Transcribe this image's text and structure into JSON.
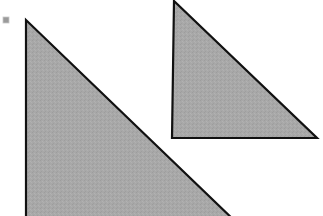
{
  "canvas": {
    "width": 323,
    "height": 216,
    "background_color": "#ffffff",
    "description": "Two gray right triangles on a white background"
  },
  "style": {
    "shape_fill_color": "#a8a8a8",
    "shape_stroke_color": "#111111",
    "shape_stroke_width": 2.2,
    "marker_fill_color": "#9a9a9a",
    "marker_border_color": "#c8c8c8",
    "texture_opacity": 0.1
  },
  "shapes": [
    {
      "name": "left-triangle",
      "label": "Large gray right triangle, clipped at bottom edge",
      "orientation": "right angle at lower-left",
      "points": "26,20 26,224 238,224",
      "vertices": [
        {
          "x": 26,
          "y": 20
        },
        {
          "x": 26,
          "y": 224
        },
        {
          "x": 238,
          "y": 224
        }
      ],
      "fill": "#a8a8a8",
      "stroke": "#111111"
    },
    {
      "name": "right-triangle",
      "label": "Smaller gray right triangle",
      "orientation": "right angle at lower-left",
      "points": "174,1 172,138 317,138",
      "vertices": [
        {
          "x": 174,
          "y": 1
        },
        {
          "x": 172,
          "y": 138
        },
        {
          "x": 317,
          "y": 138
        }
      ],
      "fill": "#a8a8a8",
      "stroke": "#111111"
    }
  ],
  "marker": {
    "name": "corner-square-marker",
    "label": "Small gray square marker at top-left",
    "x": 3,
    "y": 17,
    "width": 6,
    "height": 6,
    "fill": "#9a9a9a"
  }
}
